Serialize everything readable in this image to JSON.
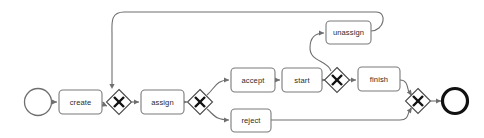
{
  "diagram": {
    "type": "bpmn-process-diagram",
    "title": "",
    "canvas": {
      "width": 484,
      "height": 138,
      "background": "#ffffff"
    },
    "colors": {
      "task_stroke": "#7a7a7a",
      "task_fill": "#ffffff",
      "gateway_stroke": "#4a4a4a",
      "gateway_marker": "#111111",
      "flow_stroke": "#6e6e6e",
      "start_event_stroke": "#6f6f6f",
      "end_event_stroke": "#111111",
      "label_text": "#2b2b2b"
    },
    "events": [
      {
        "id": "start-event",
        "name": "start-event",
        "kind": "start",
        "label": "",
        "cx": 38,
        "cy": 102,
        "r": 13.5
      },
      {
        "id": "end-event",
        "name": "end-event",
        "kind": "end",
        "label": "",
        "cx": 455,
        "cy": 101,
        "r": 12.5
      }
    ],
    "tasks": [
      {
        "id": "create",
        "label": "create",
        "x": 59,
        "y": 90,
        "w": 43,
        "h": 24
      },
      {
        "id": "assign",
        "label": "assign",
        "x": 141,
        "y": 90,
        "w": 43,
        "h": 24
      },
      {
        "id": "accept",
        "label": "accept",
        "x": 231,
        "y": 68,
        "w": 44,
        "h": 24
      },
      {
        "id": "start",
        "label": "start",
        "x": 282,
        "y": 68,
        "w": 40,
        "h": 24
      },
      {
        "id": "unassign",
        "label": "unassign",
        "x": 326,
        "y": 21,
        "w": 45,
        "h": 23
      },
      {
        "id": "finish",
        "label": "finish",
        "x": 358,
        "y": 67,
        "w": 42,
        "h": 24
      },
      {
        "id": "reject",
        "label": "reject",
        "x": 231,
        "y": 109,
        "w": 40,
        "h": 23
      }
    ],
    "gateways": [
      {
        "id": "gateway-1",
        "label": "",
        "cx": 119,
        "cy": 102,
        "r": 12.5,
        "marker": "exclusive-x"
      },
      {
        "id": "gateway-2",
        "label": "",
        "cx": 200,
        "cy": 102,
        "r": 12.5,
        "marker": "exclusive-x"
      },
      {
        "id": "gateway-3",
        "label": "",
        "cx": 337,
        "cy": 80,
        "r": 12.5,
        "marker": "exclusive-x"
      },
      {
        "id": "gateway-4",
        "label": "",
        "cx": 418,
        "cy": 101,
        "r": 12.5,
        "marker": "exclusive-x"
      }
    ],
    "flows": [
      {
        "id": "flow-start-create",
        "from": "start-event",
        "to": "create",
        "path": "M 52,102 L 57,102"
      },
      {
        "id": "flow-create-gateway1",
        "from": "create",
        "to": "gateway-1",
        "path": "M 102,102 C 106,102 104,106 107,106"
      },
      {
        "id": "flow-loopback-gateway1",
        "from": "unassign",
        "to": "gateway-1",
        "path": "M 371,31 C 384,31 388,12 376,12 L 124,12 C 110,12 112,24 112,34 L 112,87"
      },
      {
        "id": "flow-gateway1-assign",
        "from": "gateway-1",
        "to": "assign",
        "path": "M 132,102 L 139,102"
      },
      {
        "id": "flow-assign-gateway2",
        "from": "assign",
        "to": "gateway-2",
        "path": "M 184,102 L 187,102"
      },
      {
        "id": "flow-gateway2-accept",
        "from": "gateway-2",
        "to": "accept",
        "path": "M 207,95 C 215,88 216,80 229,80"
      },
      {
        "id": "flow-gateway2-reject",
        "from": "gateway-2",
        "to": "reject",
        "path": "M 207,109 C 215,116 216,120 229,120"
      },
      {
        "id": "flow-accept-start",
        "from": "accept",
        "to": "start",
        "path": "M 275,80 L 280,80"
      },
      {
        "id": "flow-start-gateway3",
        "from": "start",
        "to": "gateway-3",
        "path": "M 322,80 L 325,80"
      },
      {
        "id": "flow-gateway3-unassign",
        "from": "gateway-3",
        "to": "unassign",
        "path": "M 331,71 C 328,60 310,62 310,48 C 310,36 316,33 324,33"
      },
      {
        "id": "flow-gateway3-finish",
        "from": "gateway-3",
        "to": "finish",
        "path": "M 349,80 L 356,80"
      },
      {
        "id": "flow-finish-gateway4",
        "from": "finish",
        "to": "gateway-4",
        "path": "M 400,80 C 410,80 406,92 411,95"
      },
      {
        "id": "flow-reject-gateway4",
        "from": "reject",
        "to": "gateway-4",
        "path": "M 271,120 L 400,120 C 410,120 407,112 411,108"
      },
      {
        "id": "flow-gateway4-end",
        "from": "gateway-4",
        "to": "end-event",
        "path": "M 431,101 L 441,101"
      }
    ],
    "arrowheads": [
      {
        "id": "ah-create",
        "x": 57,
        "y": 102,
        "angle": 0
      },
      {
        "id": "ah-gateway1a",
        "x": 107,
        "y": 106,
        "angle": 20
      },
      {
        "id": "ah-gateway1b",
        "x": 112,
        "y": 89,
        "angle": 90
      },
      {
        "id": "ah-assign",
        "x": 139,
        "y": 102,
        "angle": 0
      },
      {
        "id": "ah-gateway2",
        "x": 187,
        "y": 102,
        "angle": 0
      },
      {
        "id": "ah-accept",
        "x": 229,
        "y": 80,
        "angle": 0
      },
      {
        "id": "ah-reject",
        "x": 229,
        "y": 120,
        "angle": 0
      },
      {
        "id": "ah-start",
        "x": 280,
        "y": 80,
        "angle": 0
      },
      {
        "id": "ah-gateway3",
        "x": 325,
        "y": 80,
        "angle": 0
      },
      {
        "id": "ah-unassign",
        "x": 324,
        "y": 33,
        "angle": 0
      },
      {
        "id": "ah-finish",
        "x": 356,
        "y": 80,
        "angle": 0
      },
      {
        "id": "ah-gateway4a",
        "x": 412,
        "y": 95,
        "angle": 50
      },
      {
        "id": "ah-gateway4b",
        "x": 412,
        "y": 108,
        "angle": -50
      },
      {
        "id": "ah-end",
        "x": 441,
        "y": 101,
        "angle": 0
      }
    ]
  }
}
